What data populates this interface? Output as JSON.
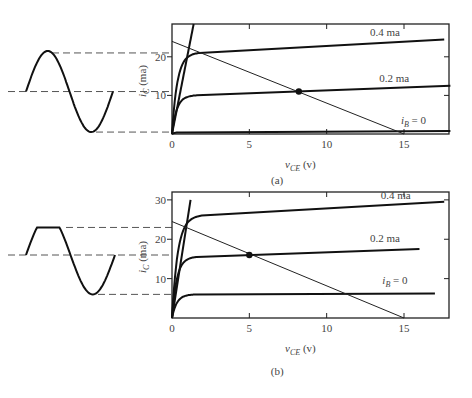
{
  "page_marker": "",
  "panels": [
    {
      "id": "a",
      "caption": "(a)",
      "xlabel_main": "v",
      "xlabel_sub": "CE",
      "xlabel_unit": " (v)",
      "ylabel_main": "i",
      "ylabel_sub": "C",
      "ylabel_unit": " (ma)",
      "xlim": [
        0,
        18
      ],
      "ylim": [
        0,
        28.5
      ],
      "xticks": [
        0,
        5,
        10,
        15
      ],
      "xtick_labels": [
        "0",
        "5",
        "10",
        "15"
      ],
      "yticks": [
        10,
        20
      ],
      "ytick_labels": [
        "10",
        "20"
      ],
      "curves": [
        {
          "label": "i_B = 0",
          "label_main": "i",
          "label_sub": "B",
          "label_rest": " = 0",
          "sat_level": 0.4,
          "end": [
            18,
            0.8
          ],
          "knee": 0.4,
          "label_at": [
            14.8,
            2.5
          ]
        },
        {
          "label": "0.2 ma",
          "sat_level": 10,
          "end": [
            18,
            12.5
          ],
          "knee": 1.0,
          "label_at": [
            13.4,
            13.6
          ]
        },
        {
          "label": "0.4 ma",
          "sat_level": 21,
          "end": [
            17.6,
            24.5
          ],
          "knee": 1.1,
          "label_at": [
            12.8,
            25.5
          ]
        }
      ],
      "saturation_line": {
        "from": [
          0,
          0
        ],
        "to": [
          1.4,
          28.5
        ]
      },
      "load_line": {
        "from": [
          0,
          24
        ],
        "to": [
          15,
          0
        ]
      },
      "q_point": [
        8.2,
        11
      ],
      "input_wave": {
        "type": "sine",
        "center": 11,
        "max": 21,
        "min": 0.5,
        "clipped": false
      },
      "dashed_levels": [
        21,
        11,
        0.5
      ]
    },
    {
      "id": "b",
      "caption": "(b)",
      "xlabel_main": "v",
      "xlabel_sub": "CE",
      "xlabel_unit": " (v)",
      "ylabel_main": "i",
      "ylabel_sub": "C",
      "ylabel_unit": " (ma)",
      "xlim": [
        0,
        18
      ],
      "ylim": [
        0,
        32
      ],
      "xticks": [
        0,
        5,
        10,
        15
      ],
      "xtick_labels": [
        "0",
        "5",
        "10",
        "15"
      ],
      "yticks": [
        10,
        20,
        30
      ],
      "ytick_labels": [
        "10",
        "20",
        "30"
      ],
      "curves": [
        {
          "label": "i_B = 0",
          "label_main": "i",
          "label_sub": "B",
          "label_rest": " = 0",
          "sat_level": 6,
          "end": [
            17,
            6.2
          ],
          "knee": 1.0,
          "label_at": [
            13.6,
            8.7
          ]
        },
        {
          "label": "0.2 ma",
          "sat_level": 15.5,
          "end": [
            16,
            17.5
          ],
          "knee": 1.0,
          "label_at": [
            12.8,
            19.4
          ]
        },
        {
          "label": "0.4 ma",
          "sat_level": 26,
          "end": [
            17.6,
            29.5
          ],
          "knee": 1.2,
          "label_at": [
            13.5,
            30.3
          ]
        }
      ],
      "saturation_line": {
        "from": [
          0,
          0
        ],
        "to": [
          1.2,
          30
        ]
      },
      "load_line": {
        "from": [
          0,
          24.5
        ],
        "to": [
          15,
          0
        ]
      },
      "q_point": [
        5,
        16
      ],
      "input_wave": {
        "type": "clipped-sine",
        "center": 16,
        "max": 23,
        "min": 6,
        "clipped": true
      },
      "dashed_levels": [
        23,
        16,
        6
      ]
    }
  ]
}
